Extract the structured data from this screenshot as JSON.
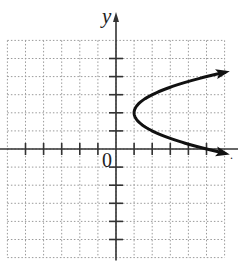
{
  "chart_data": {
    "type": "line",
    "title": "",
    "xlabel": "",
    "ylabel": "y",
    "origin_label": "0",
    "xlim": [
      -6,
      6
    ],
    "ylim": [
      -6,
      6
    ],
    "grid": true,
    "grid_style": "dotted",
    "x_ticks": [
      -5,
      -4,
      -3,
      -2,
      -1,
      1,
      2,
      3,
      4,
      5
    ],
    "y_ticks": [
      -5,
      -4,
      -3,
      -2,
      -1,
      1,
      2,
      3,
      4,
      5
    ],
    "series": [
      {
        "name": "x = (y - 2)^2 + 1",
        "equation": "x = (y - 2)^2 + 1",
        "vertex": [
          1,
          2
        ],
        "opens": "right",
        "arrows": "both ends",
        "points": [
          [
            6,
            4.24
          ],
          [
            5,
            4
          ],
          [
            3,
            3.41
          ],
          [
            2,
            3
          ],
          [
            1.25,
            2.5
          ],
          [
            1,
            2
          ],
          [
            1.25,
            1.5
          ],
          [
            2,
            1
          ],
          [
            3,
            0.59
          ],
          [
            5,
            0
          ],
          [
            6,
            -0.24
          ]
        ]
      }
    ]
  },
  "labels": {
    "y_axis": "y",
    "origin": "0",
    "trailing_mark": "."
  },
  "style": {
    "curve_color": "#111111",
    "axis_color": "#333333",
    "grid_color": "#9a9a9a"
  }
}
